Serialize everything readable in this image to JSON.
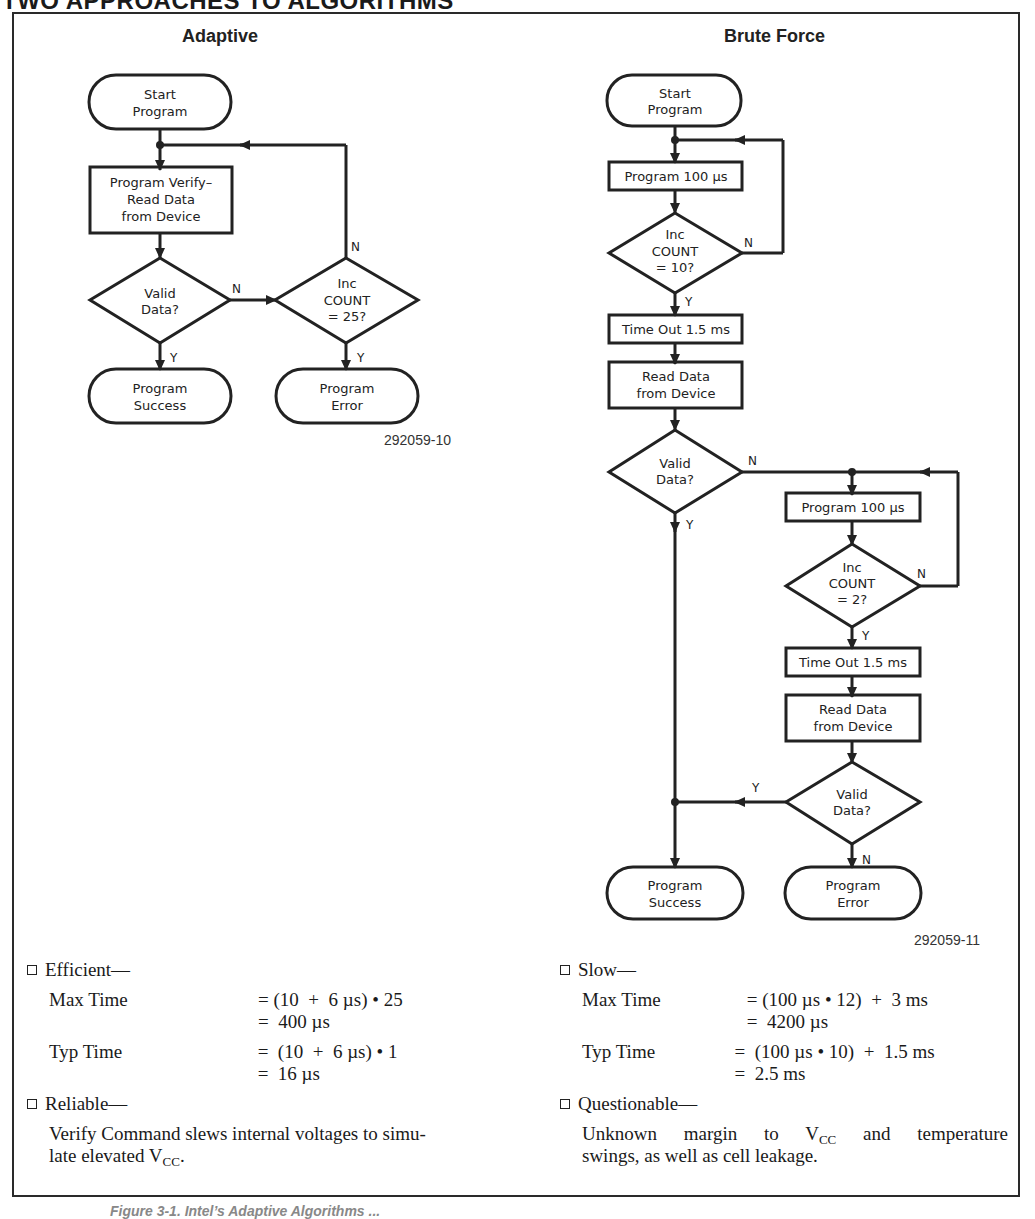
{
  "page": {
    "title": "TWO APPROACHES TO ALGORITHMS",
    "caption": "Figure 3-1. Intel’s Adaptive Algorithms ..."
  },
  "adaptive": {
    "title": "Adaptive",
    "figure_id": "292059-10",
    "nodes": {
      "start": [
        "Start",
        "Program"
      ],
      "verify": [
        "Program Verify–",
        "Read Data",
        "from Device"
      ],
      "valid": [
        "Valid",
        "Data?"
      ],
      "inc": [
        "Inc",
        "COUNT",
        "= 25?"
      ],
      "success": [
        "Program",
        "Success"
      ],
      "error": [
        "Program",
        "Error"
      ]
    },
    "edge_labels": {
      "valid_no": "N",
      "valid_yes": "Y",
      "inc_no": "N",
      "inc_yes": "Y"
    }
  },
  "brute_force": {
    "title": "Brute Force",
    "figure_id": "292059-11",
    "nodes": {
      "start": [
        "Start",
        "Program"
      ],
      "program1": "Program 100 µs",
      "inc1": [
        "Inc",
        "COUNT",
        "= 10?"
      ],
      "timeout1": "Time Out 1.5 ms",
      "read1": [
        "Read Data",
        "from Device"
      ],
      "valid1": [
        "Valid",
        "Data?"
      ],
      "program2": "Program 100 µs",
      "inc2": [
        "Inc",
        "COUNT",
        "= 2?"
      ],
      "timeout2": "Time Out 1.5 ms",
      "read2": [
        "Read Data",
        "from Device"
      ],
      "valid2": [
        "Valid",
        "Data?"
      ],
      "success": [
        "Program",
        "Success"
      ],
      "error": [
        "Program",
        "Error"
      ]
    },
    "edge_labels": {
      "inc1_no": "N",
      "inc1_yes": "Y",
      "valid1_no": "N",
      "valid1_yes": "Y",
      "inc2_no": "N",
      "inc2_yes": "Y",
      "valid2_yes": "Y",
      "valid2_no": "N"
    }
  },
  "notes": {
    "left": {
      "heading1": "Efficient—",
      "max_label": "Max Time",
      "max_line1": "= (10  +  6 µs) • 25",
      "max_line2": "=  400 µs",
      "typ_label": "Typ Time",
      "typ_line1": "=  (10  +  6 µs) • 1",
      "typ_line2": "=  16 µs",
      "heading2": "Reliable—",
      "para_a": "Verify Command slews internal voltages to simu-",
      "para_b": "late elevated V",
      "para_sub": "CC",
      "para_end": "."
    },
    "right": {
      "heading1": "Slow—",
      "max_label": "Max Time",
      "max_line1": "= (100 µs • 12)  +  3 ms",
      "max_line2": "=  4200 µs",
      "typ_label": "Typ Time",
      "typ_line1": "=  (100 µs • 10)  +  1.5 ms",
      "typ_line2": "=  2.5 ms",
      "heading2": "Questionable—",
      "para_a1": "Unknown margin to V",
      "para_a_sub": "CC",
      "para_a2": " and temperature",
      "para_b": "swings, as well as cell leakage."
    }
  }
}
